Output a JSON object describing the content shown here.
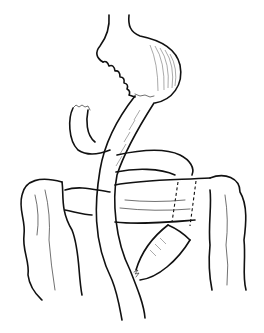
{
  "illustration": {
    "subject": "surgical anatomy line drawing",
    "colors": {
      "background": "#ffffff",
      "ink": "#111111"
    },
    "parts": [
      "gastric-pouch",
      "jejunal-limb",
      "duodenal-stump",
      "transverse-colon",
      "ascending-colon",
      "descending-colon",
      "jejunojejunal-anastomosis"
    ]
  }
}
